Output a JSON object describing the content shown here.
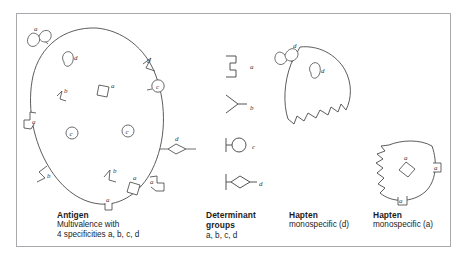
{
  "figure": {
    "kind": "immunology-schematic",
    "background_color": "#ffffff",
    "border_color": "#a9a9ad",
    "ink_color": "#3a3a3a",
    "stipple_color": "#b9b6b1"
  },
  "panels": [
    {
      "id": "antigen",
      "title": "Antigen",
      "lines": [
        "Multivalence with",
        "4 specificities a, b, c, d"
      ],
      "shape": "large-stippled-oval"
    },
    {
      "id": "determinant-groups",
      "title": "Determinant",
      "lines": [
        "groups",
        "a, b, c, d"
      ],
      "shape": "symbol-key-column"
    },
    {
      "id": "hapten-d",
      "title": "Hapten",
      "lines": [
        "monospecific (d)"
      ],
      "shape": "torn-wedge-fragment"
    },
    {
      "id": "hapten-a",
      "title": "Hapten",
      "lines": [
        "monospecific (a)"
      ],
      "shape": "torn-wedge-fragment"
    }
  ],
  "determinant_key": [
    {
      "letter": "a",
      "glyph": "square-step-bracket"
    },
    {
      "letter": "b",
      "glyph": "v-notch-arrow"
    },
    {
      "letter": "c",
      "glyph": "circle-on-stem"
    },
    {
      "letter": "d",
      "glyph": "lens-on-stem"
    }
  ],
  "antigen_markers": {
    "edge": [
      {
        "letter": "d",
        "glyph": "lens-on-stem",
        "position": "upper-left"
      },
      {
        "letter": "b",
        "glyph": "v-notch-arrow",
        "position": "upper-right"
      },
      {
        "letter": "c",
        "glyph": "circle-on-stem",
        "position": "right-upper"
      },
      {
        "letter": "d",
        "glyph": "lens-on-stem",
        "position": "right-middle"
      },
      {
        "letter": "a",
        "glyph": "square-step-bracket",
        "position": "left-middle"
      },
      {
        "letter": "b",
        "glyph": "v-notch-arrow",
        "position": "left-lower"
      },
      {
        "letter": "a",
        "glyph": "square-step-bracket",
        "position": "right-lower"
      },
      {
        "letter": "a",
        "glyph": "square-step-bracket",
        "position": "bottom"
      }
    ],
    "interior": [
      {
        "letter": "d",
        "glyph": "lens",
        "position": "top-inner"
      },
      {
        "letter": "b",
        "glyph": "v-notch",
        "position": "left-inner"
      },
      {
        "letter": "a",
        "glyph": "square",
        "position": "center-upper"
      },
      {
        "letter": "c",
        "glyph": "circled-c",
        "position": "center-left"
      },
      {
        "letter": "c",
        "glyph": "circled-c",
        "position": "center-right"
      },
      {
        "letter": "b",
        "glyph": "v-notch",
        "position": "lower-inner"
      },
      {
        "letter": "a",
        "glyph": "square",
        "position": "lower-center"
      }
    ]
  },
  "hapten_d_markers": {
    "edge": [
      {
        "letter": "d",
        "glyph": "lens-on-stem",
        "position": "upper-left"
      }
    ],
    "interior": [
      {
        "letter": "d",
        "glyph": "lens",
        "position": "center"
      }
    ]
  },
  "hapten_a_markers": {
    "edge": [
      {
        "letter": "a",
        "glyph": "square-step-bracket",
        "position": "right"
      },
      {
        "letter": "a",
        "glyph": "square-step-bracket",
        "position": "bottom"
      }
    ],
    "interior": [
      {
        "letter": "a",
        "glyph": "square",
        "position": "center"
      }
    ]
  }
}
